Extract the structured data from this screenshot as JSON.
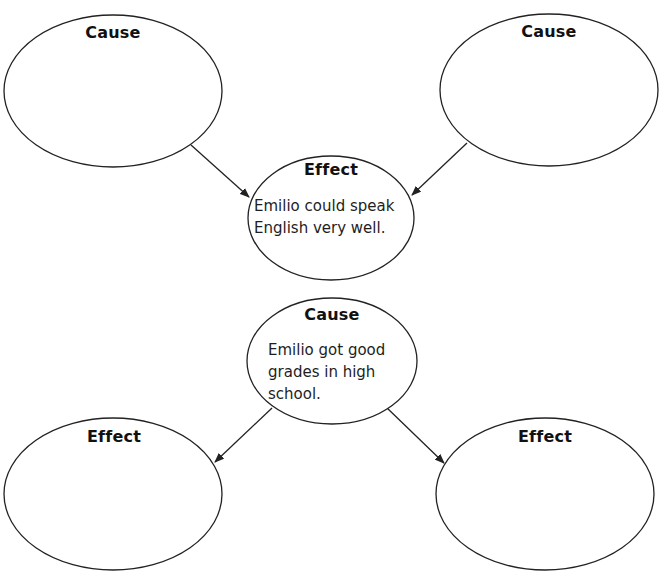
{
  "diagram": {
    "type": "cause-and-effect organizer",
    "colors": {
      "stroke": "#222222",
      "text": "#111111",
      "background": "#ffffff"
    },
    "top_section": {
      "causes": [
        {
          "id": "cause-top-left",
          "heading": "Cause",
          "text": ""
        },
        {
          "id": "cause-top-right",
          "heading": "Cause",
          "text": ""
        }
      ],
      "effect": {
        "id": "effect-center",
        "heading": "Effect",
        "lines": [
          "Emilio could speak",
          "English very well."
        ]
      }
    },
    "bottom_section": {
      "cause": {
        "id": "cause-center",
        "heading": "Cause",
        "lines": [
          "Emilio got good",
          "grades in high",
          "school."
        ]
      },
      "effects": [
        {
          "id": "effect-bottom-left",
          "heading": "Effect",
          "text": ""
        },
        {
          "id": "effect-bottom-right",
          "heading": "Effect",
          "text": ""
        }
      ]
    },
    "arrows": [
      {
        "from": "cause-top-left",
        "to": "effect-center"
      },
      {
        "from": "cause-top-right",
        "to": "effect-center"
      },
      {
        "from": "cause-center",
        "to": "effect-bottom-left"
      },
      {
        "from": "cause-center",
        "to": "effect-bottom-right"
      }
    ]
  }
}
